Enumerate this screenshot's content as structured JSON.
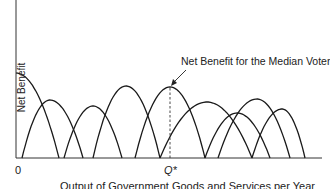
{
  "chart_data": {
    "type": "line",
    "title": "",
    "xlabel": "Output of Government Goods and Services per Year",
    "ylabel": "Net Benefit",
    "x_ticks": [
      "0",
      "Q*"
    ],
    "annotation": "Net Benefit for the Median Voter",
    "grid": false,
    "legend": null,
    "series": [
      {
        "name": "Voter 1",
        "root_left": 0,
        "root_right": 59,
        "peak_x": 16,
        "peak_y": 85
      },
      {
        "name": "Voter 2",
        "root_left": 22,
        "root_right": 83,
        "peak_x": 50,
        "peak_y": 58
      },
      {
        "name": "Voter 3",
        "root_left": 64,
        "root_right": 122,
        "peak_x": 93,
        "peak_y": 52
      },
      {
        "name": "Voter 4",
        "root_left": 93,
        "root_right": 160,
        "peak_x": 126,
        "peak_y": 72
      },
      {
        "name": "Median Voter",
        "root_left": 135,
        "root_right": 205,
        "peak_x": 170,
        "peak_y": 71,
        "median": true
      },
      {
        "name": "Voter 6",
        "root_left": 160,
        "root_right": 252,
        "peak_x": 207,
        "peak_y": 56
      },
      {
        "name": "Voter 7",
        "root_left": 205,
        "root_right": 270,
        "peak_x": 237,
        "peak_y": 45
      },
      {
        "name": "Voter 8",
        "root_left": 218,
        "root_right": 290,
        "peak_x": 257,
        "peak_y": 59
      },
      {
        "name": "Voter 9",
        "root_left": 252,
        "root_right": 305,
        "peak_x": 282,
        "peak_y": 49
      }
    ]
  },
  "labels": {
    "ylabel": "Net Benefit",
    "origin": "0",
    "qstar": "Q*",
    "xlabel": "Output of Government Goods and Services per Year",
    "annotation": "Net Benefit for the Median Voter"
  },
  "colors": {
    "curve": "#1a1a1a",
    "axis": "#333333"
  }
}
